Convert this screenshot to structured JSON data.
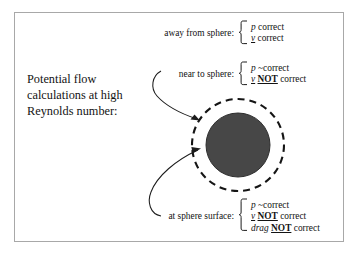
{
  "figure": {
    "heading_lines": [
      "Potential flow",
      "calculations at high",
      "Reynolds number:"
    ],
    "groups": [
      {
        "id": "away-from-sphere",
        "label": "away from sphere:",
        "items": [
          {
            "symbol": "p",
            "symbol_style": "italic",
            "qualifier": "",
            "negation": "",
            "verdict": "correct"
          },
          {
            "symbol": "v",
            "symbol_style": "italic-underline",
            "qualifier": "",
            "negation": "",
            "verdict": "correct"
          }
        ]
      },
      {
        "id": "near-to-sphere",
        "label": "near to sphere:",
        "items": [
          {
            "symbol": "p",
            "symbol_style": "italic",
            "qualifier": "~",
            "negation": "",
            "verdict": "correct"
          },
          {
            "symbol": "v",
            "symbol_style": "italic-underline",
            "qualifier": "",
            "negation": "NOT",
            "verdict": "correct"
          }
        ]
      },
      {
        "id": "at-sphere-surface",
        "label": "at sphere surface:",
        "items": [
          {
            "symbol": "p",
            "symbol_style": "italic",
            "qualifier": "~",
            "negation": "",
            "verdict": "correct"
          },
          {
            "symbol": "v",
            "symbol_style": "italic-underline",
            "qualifier": "",
            "negation": "NOT",
            "verdict": "correct"
          },
          {
            "symbol": "drag",
            "symbol_style": "italic",
            "qualifier": "",
            "negation": "NOT",
            "verdict": "correct"
          }
        ]
      }
    ],
    "diagram": {
      "sphere_label": "sphere",
      "boundary_label": "boundary layer region",
      "sphere_fill_color": "#474747",
      "dashed_stroke_color": "#151515",
      "frame_color": "#a8a8a8",
      "background_color": "#ffffff"
    }
  }
}
